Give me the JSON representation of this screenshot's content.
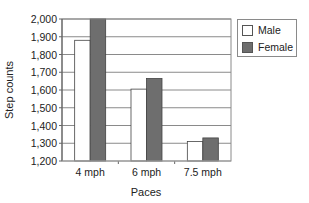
{
  "chart_data": {
    "type": "bar",
    "title": "",
    "xlabel": "Paces",
    "ylabel": "Step counts",
    "categories": [
      "4 mph",
      "6 mph",
      "7.5 mph"
    ],
    "series": [
      {
        "name": "Male",
        "values": [
          1880,
          1605,
          1310
        ],
        "color": "#ffffff"
      },
      {
        "name": "Female",
        "values": [
          2000,
          1665,
          1330
        ],
        "color": "#6e6e6e"
      }
    ],
    "ylim": [
      1200,
      2000
    ],
    "yticks": [
      1200,
      1300,
      1400,
      1500,
      1600,
      1700,
      1800,
      1900,
      2000
    ],
    "ytick_labels": [
      "1,200",
      "1,300",
      "1,400",
      "1,500",
      "1,600",
      "1,700",
      "1,800",
      "1,900",
      "2,000"
    ],
    "grid": true,
    "legend_position": "right-top"
  },
  "legend": {
    "items": [
      {
        "label": "Male",
        "color": "#ffffff"
      },
      {
        "label": "Female",
        "color": "#6e6e6e"
      }
    ]
  }
}
